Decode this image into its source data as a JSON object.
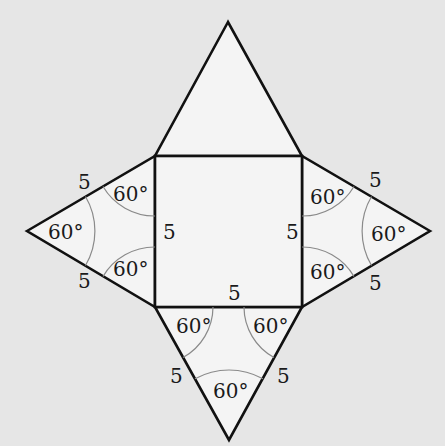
{
  "diagram": {
    "colors": {
      "background": "#e6e6e6",
      "face_fill": "#f4f4f4",
      "edge": "#111111",
      "angle_arc": "#8a8a8a",
      "text": "#1a1a1a"
    },
    "square": {
      "edge_labels": {
        "left": "5",
        "right": "5",
        "bottom": "5"
      }
    },
    "triangles": {
      "top": {
        "angle_labels": []
      },
      "left": {
        "edge_labels": {
          "upper": "5",
          "lower": "5"
        },
        "angle_labels": {
          "apex": "60°",
          "upper": "60°",
          "lower": "60°"
        }
      },
      "right": {
        "edge_labels": {
          "upper": "5",
          "lower": "5"
        },
        "angle_labels": {
          "apex": "60°",
          "upper": "60°",
          "lower": "60°"
        }
      },
      "bottom": {
        "edge_labels": {
          "left": "5",
          "right": "5"
        },
        "angle_labels": {
          "apex": "60°",
          "left": "60°",
          "right": "60°"
        }
      }
    }
  }
}
